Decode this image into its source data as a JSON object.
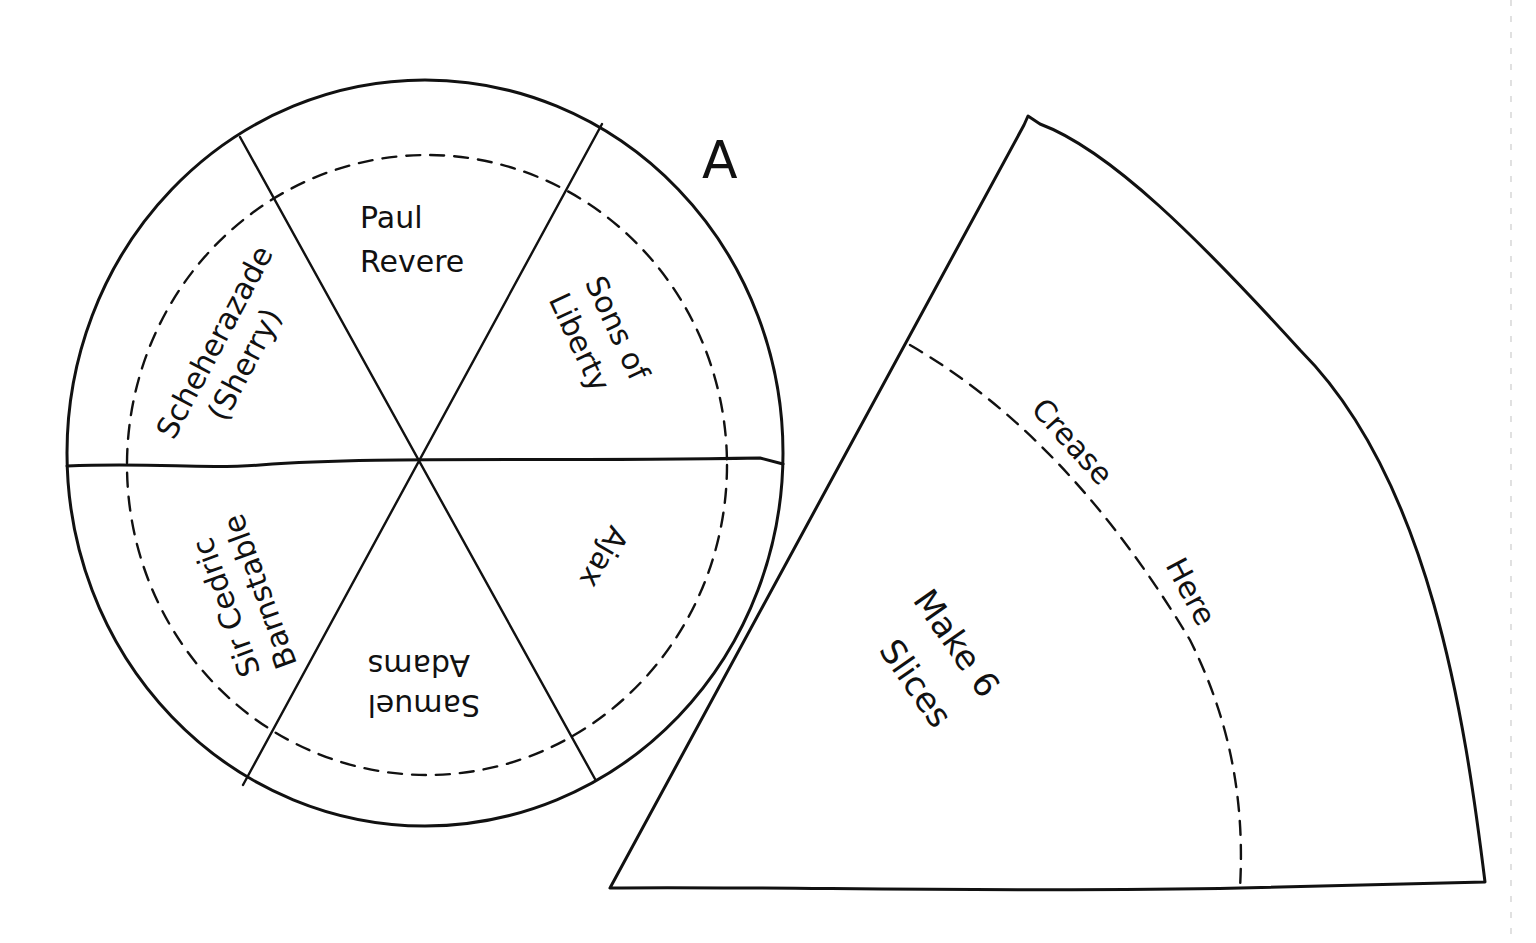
{
  "diagram": {
    "pattern_label": "A",
    "circle": {
      "slices": [
        {
          "lines": [
            "Paul",
            "Revere"
          ]
        },
        {
          "lines": [
            "Sons of",
            "Liberty"
          ]
        },
        {
          "lines": [
            "Ajax"
          ]
        },
        {
          "lines": [
            "Samuel",
            "Adams"
          ]
        },
        {
          "lines": [
            "Sir Cedric",
            "Barnstable"
          ]
        },
        {
          "lines": [
            "Scheherazade",
            "(Sherry)"
          ]
        }
      ]
    },
    "wedge": {
      "crease_label": [
        "Crease",
        "Here"
      ],
      "instruction": [
        "Make 6",
        "Slices"
      ]
    }
  }
}
